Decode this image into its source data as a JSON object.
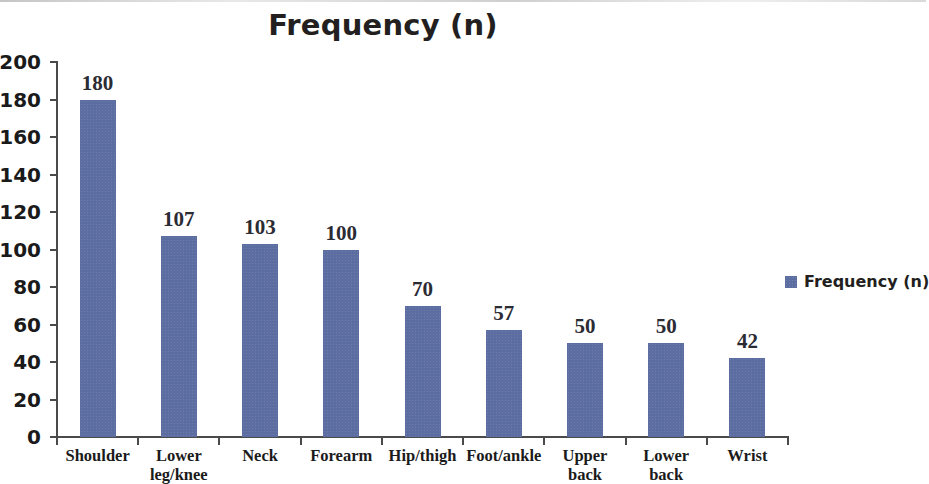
{
  "chart_data": {
    "type": "bar",
    "title": "Frequency (n)",
    "xlabel": "",
    "ylabel": "",
    "ylim": [
      0,
      200
    ],
    "ytick_step": 20,
    "yticks": [
      200,
      180,
      160,
      140,
      120,
      100,
      80,
      60,
      40,
      20,
      0
    ],
    "grid": false,
    "legend_position": "right",
    "categories": [
      "Shoulder",
      "Lower leg/knee",
      "Neck",
      "Forearm",
      "Hip/thigh",
      "Foot/ankle",
      "Upper back",
      "Lower back",
      "Wrist"
    ],
    "values": [
      180,
      107,
      103,
      100,
      70,
      57,
      50,
      50,
      42
    ],
    "series": [
      {
        "name": "Frequency (n)",
        "values": [
          180,
          107,
          103,
          100,
          70,
          57,
          50,
          50,
          42
        ],
        "color": "#5c6da1"
      }
    ],
    "data_labels": [
      "180",
      "107",
      "103",
      "100",
      "70",
      "57",
      "50",
      "50",
      "42"
    ]
  },
  "legend": {
    "entries": [
      {
        "label": "Frequency (n)",
        "color": "#5c6da1"
      }
    ]
  },
  "colors": {
    "bar": "#5c6da1",
    "axis": "#4a4a4a",
    "tick_text": "#1a1a1a",
    "data_label_text": "#2b2b33",
    "category_text": "#1b1b1b",
    "title_text": "#231f20",
    "background": "#ffffff"
  }
}
